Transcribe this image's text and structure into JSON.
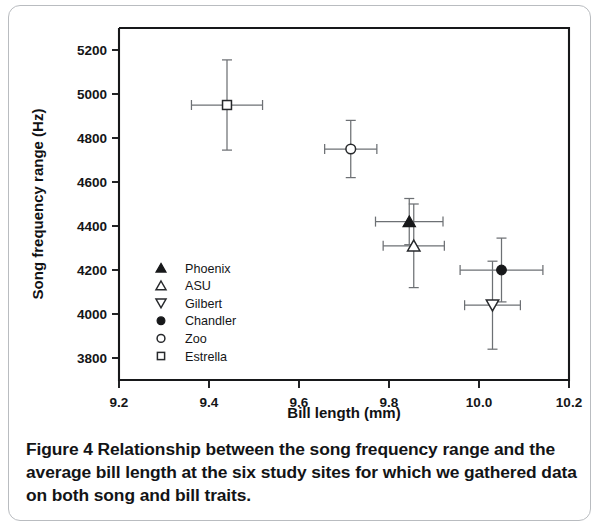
{
  "figure": {
    "caption_label": "Figure 4",
    "caption_text": "Relationship between the song frequency range and the average bill length at the six study sites for which we gathered data on both song and bill traits."
  },
  "chart_data": {
    "type": "scatter",
    "title": "",
    "xlabel": "Bill length (mm)",
    "ylabel": "Song frequency range (Hz)",
    "xlim": [
      9.2,
      10.2
    ],
    "ylim": [
      3700,
      5300
    ],
    "xticks": [
      "9.2",
      "9.4",
      "9.6",
      "9.8",
      "10.0",
      "10.2"
    ],
    "xtick_values": [
      9.2,
      9.4,
      9.6,
      9.8,
      10.0,
      10.2
    ],
    "yticks": [
      "3800",
      "4000",
      "4200",
      "4400",
      "4600",
      "4800",
      "5000",
      "5200"
    ],
    "ytick_values": [
      3800,
      4000,
      4200,
      4400,
      4600,
      4800,
      5000,
      5200
    ],
    "grid": false,
    "legend_position": "inside-left-lower",
    "error_bars": "both x and y",
    "points": [
      {
        "name": "Phoenix",
        "marker": "filled-triangle-up",
        "x": 9.845,
        "y": 4420,
        "xerr": 0.075,
        "yerr": 105
      },
      {
        "name": "ASU",
        "marker": "open-triangle-up",
        "x": 9.855,
        "y": 4310,
        "xerr": 0.068,
        "yerr": 190
      },
      {
        "name": "Gilbert",
        "marker": "open-triangle-down",
        "x": 10.03,
        "y": 4040,
        "xerr": 0.062,
        "yerr": 200
      },
      {
        "name": "Chandler",
        "marker": "filled-circle",
        "x": 10.05,
        "y": 4200,
        "xerr": 0.092,
        "yerr": 145
      },
      {
        "name": "Zoo",
        "marker": "open-circle",
        "x": 9.715,
        "y": 4750,
        "xerr": 0.058,
        "yerr": 130
      },
      {
        "name": "Estrella",
        "marker": "open-square",
        "x": 9.44,
        "y": 4950,
        "xerr": 0.079,
        "yerr": 205
      }
    ],
    "legend": [
      {
        "label": "Phoenix",
        "marker": "filled-triangle-up"
      },
      {
        "label": "ASU",
        "marker": "open-triangle-up"
      },
      {
        "label": "Gilbert",
        "marker": "open-triangle-down"
      },
      {
        "label": "Chandler",
        "marker": "filled-circle"
      },
      {
        "label": "Zoo",
        "marker": "open-circle"
      },
      {
        "label": "Estrella",
        "marker": "open-square"
      }
    ],
    "colors": {
      "axis": "#17181a",
      "marker_fill": "#17181a",
      "marker_open": "#ffffff",
      "error_bar": "#6d7074",
      "text": "#141517"
    }
  }
}
